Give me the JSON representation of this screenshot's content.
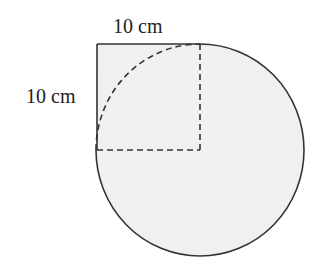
{
  "diagram": {
    "type": "geometry",
    "labels": {
      "top": "10 cm",
      "left": "10 cm"
    },
    "square": {
      "side_cm": 10
    },
    "circle": {
      "radius_cm": 10,
      "center": "bottom-right corner of square"
    },
    "colors": {
      "fill": "#f0f0f0",
      "stroke": "#333333",
      "background": "#ffffff"
    }
  }
}
